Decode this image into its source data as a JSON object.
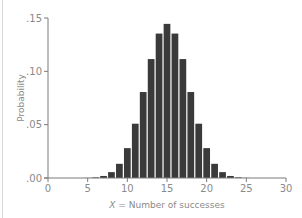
{
  "chart_data": {
    "type": "bar",
    "title": "",
    "xlabel_var": "X",
    "xlabel": "X = Number of successes",
    "ylabel": "Probability",
    "xlim": [
      0,
      30
    ],
    "ylim": [
      0,
      0.15
    ],
    "xticks": [
      0,
      5,
      10,
      15,
      20,
      25,
      30
    ],
    "xtick_labels": [
      "0",
      "5",
      "10",
      "15",
      "20",
      "25",
      "30"
    ],
    "yticks": [
      0,
      0.05,
      0.1,
      0.15
    ],
    "ytick_labels": [
      ".00",
      ".05",
      ".10",
      ".15"
    ],
    "grid": false,
    "legend": null,
    "bar_color": "#3a3a3a",
    "axis_color": "#7a7a7a",
    "categories": [
      5,
      6,
      7,
      8,
      9,
      10,
      11,
      12,
      13,
      14,
      15,
      16,
      17,
      18,
      19,
      20,
      21,
      22,
      23,
      24,
      25
    ],
    "values": [
      0.0001,
      0.0006,
      0.0019,
      0.0055,
      0.0133,
      0.028,
      0.0509,
      0.0806,
      0.1115,
      0.1354,
      0.1445,
      0.1354,
      0.1115,
      0.0806,
      0.0509,
      0.028,
      0.0133,
      0.0055,
      0.0019,
      0.0006,
      0.0001
    ]
  }
}
